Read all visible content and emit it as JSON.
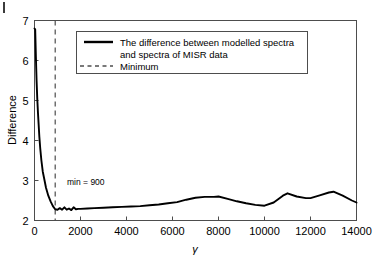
{
  "figure": {
    "name": "difference-vs-gamma-plot",
    "background": "#ffffff",
    "corner_mark": "",
    "line_color": "#000000",
    "minimum_line_color": "#4d4d4d",
    "axis_color": "#4d4d4d"
  },
  "annotations": {
    "minimum_label": "min = 900"
  },
  "legend": {
    "entries": [
      {
        "label_line1": "The difference between modelled spectra",
        "label_line2": "and spectra of MISR data",
        "style": "solid"
      },
      {
        "label_line1": "Minimum",
        "label_line2": "",
        "style": "dashed"
      }
    ]
  },
  "chart_data": {
    "type": "line",
    "title": "",
    "xlabel": "γ",
    "ylabel": "Difference",
    "xlim": [
      0,
      14000
    ],
    "ylim": [
      2,
      7
    ],
    "xticks": [
      0,
      2000,
      4000,
      6000,
      8000,
      10000,
      12000,
      14000
    ],
    "xticklabels": [
      "0",
      "2000",
      "4000",
      "6000",
      "8000",
      "10000",
      "12000",
      "14000"
    ],
    "yticks": [
      2,
      3,
      4,
      5,
      6,
      7
    ],
    "yticklabels": [
      "2",
      "3",
      "4",
      "5",
      "6",
      "7"
    ],
    "grid": false,
    "legend_position": "upper-center",
    "series": [
      {
        "name": "The difference between modelled spectra and spectra of MISR data",
        "style": "solid",
        "color": "#000000",
        "x": [
          0,
          30,
          60,
          90,
          120,
          150,
          180,
          210,
          250,
          300,
          360,
          420,
          500,
          600,
          700,
          800,
          900,
          1000,
          1100,
          1200,
          1300,
          1400,
          1500,
          1600,
          1700,
          1800,
          1900,
          2000,
          2300,
          2600,
          3000,
          3400,
          3800,
          4200,
          4600,
          5000,
          5400,
          5800,
          6200,
          6600,
          7000,
          7400,
          7800,
          8000,
          8400,
          8800,
          9200,
          9600,
          10000,
          10400,
          10800,
          11000,
          11400,
          11800,
          12000,
          12400,
          12800,
          13000,
          13400,
          13800,
          14000
        ],
        "y": [
          6.8,
          6.78,
          6.1,
          5.5,
          5.05,
          4.7,
          4.4,
          4.1,
          3.8,
          3.5,
          3.22,
          3.05,
          2.82,
          2.62,
          2.48,
          2.36,
          2.28,
          2.27,
          2.31,
          2.27,
          2.33,
          2.27,
          2.3,
          2.26,
          2.33,
          2.28,
          2.29,
          2.29,
          2.3,
          2.31,
          2.32,
          2.33,
          2.34,
          2.35,
          2.36,
          2.38,
          2.4,
          2.43,
          2.46,
          2.52,
          2.57,
          2.59,
          2.59,
          2.6,
          2.54,
          2.48,
          2.43,
          2.39,
          2.37,
          2.45,
          2.62,
          2.68,
          2.6,
          2.56,
          2.56,
          2.63,
          2.7,
          2.72,
          2.62,
          2.5,
          2.45
        ]
      },
      {
        "name": "Minimum",
        "style": "dashed",
        "color": "#4d4d4d",
        "x_constant": 900
      }
    ]
  }
}
